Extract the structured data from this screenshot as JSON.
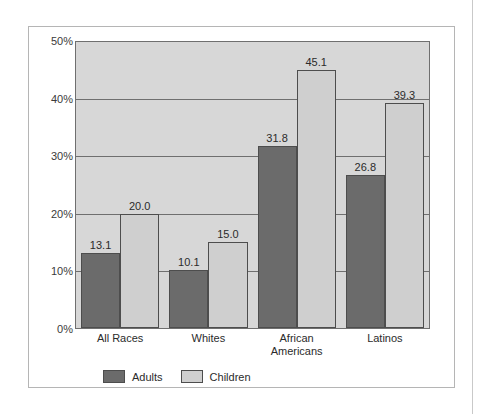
{
  "chart_data": {
    "type": "bar",
    "title": "",
    "subtitle": "",
    "xlabel": "",
    "ylabel": "",
    "ylim": [
      0,
      50
    ],
    "ytick_labels": [
      "0%",
      "10%",
      "20%",
      "30%",
      "40%",
      "50%"
    ],
    "ytick_values": [
      0,
      10,
      20,
      30,
      40,
      50
    ],
    "grid": true,
    "legend_position": "bottom-left",
    "categories": [
      "All Races",
      "Whites",
      "African Americans",
      "Latinos"
    ],
    "category_lines": [
      [
        "All Races"
      ],
      [
        "Whites"
      ],
      [
        "African",
        "Americans"
      ],
      [
        "Latinos"
      ]
    ],
    "series": [
      {
        "name": "Adults",
        "color": "#6b6b6b",
        "values": [
          13.1,
          10.1,
          31.8,
          26.8
        ],
        "labels": [
          "13.1",
          "10.1",
          "31.8",
          "26.8"
        ]
      },
      {
        "name": "Children",
        "color": "#cfcfcf",
        "values": [
          20.0,
          15.0,
          45.1,
          39.3
        ],
        "labels": [
          "20.0",
          "15.0",
          "45.1",
          "39.3"
        ]
      }
    ],
    "plot_background": "#d7d7d7",
    "gridline_color": "#6f6f6f"
  },
  "legend": {
    "items": [
      {
        "label": "Adults"
      },
      {
        "label": "Children"
      }
    ]
  }
}
